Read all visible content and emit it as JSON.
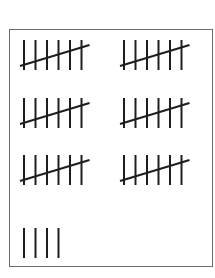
{
  "tally_sheet": {
    "stroke_color": "#1e1e1e",
    "groups": [
      {
        "row": 0,
        "col": 0,
        "verticals": 6,
        "slashed": true
      },
      {
        "row": 0,
        "col": 1,
        "verticals": 6,
        "slashed": true
      },
      {
        "row": 1,
        "col": 0,
        "verticals": 6,
        "slashed": true
      },
      {
        "row": 1,
        "col": 1,
        "verticals": 6,
        "slashed": true
      },
      {
        "row": 2,
        "col": 0,
        "verticals": 6,
        "slashed": true
      },
      {
        "row": 2,
        "col": 1,
        "verticals": 6,
        "slashed": true
      },
      {
        "row": 3,
        "col": 0,
        "verticals": 4,
        "slashed": false
      }
    ]
  }
}
